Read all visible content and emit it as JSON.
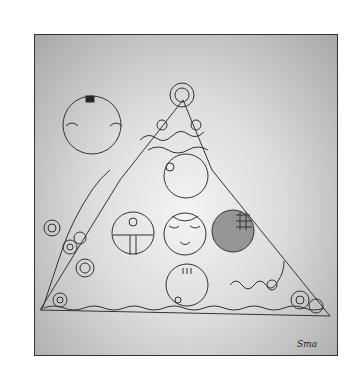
{
  "artwork": {
    "description": "Pencil drawing: pyramid with circular faces, spiral flower vines, and a moon circle in a gray sky",
    "signature": "Sma",
    "colors": {
      "paper": "#ffffff",
      "sky_dark": "#a8a8a8",
      "sky_light": "#f4f4f4",
      "ink": "#333333",
      "shaded_orb": "#7a7a7a"
    }
  }
}
